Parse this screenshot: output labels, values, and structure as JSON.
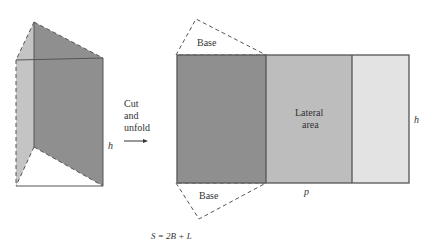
{
  "prism": {
    "height_label": "h"
  },
  "transition": {
    "line1": "Cut",
    "line2": "and",
    "line3": "unfold"
  },
  "net": {
    "base_top_label": "Base",
    "base_bottom_label": "Base",
    "lateral_line1": "Lateral",
    "lateral_line2": "area",
    "height_label": "h",
    "perimeter_label": "p"
  },
  "formula": "S = 2B + L",
  "colors": {
    "dark_face": "#8f8f8f",
    "mid_face": "#bdbdbd",
    "light_face": "#e3e3e3",
    "edge": "#555555"
  }
}
